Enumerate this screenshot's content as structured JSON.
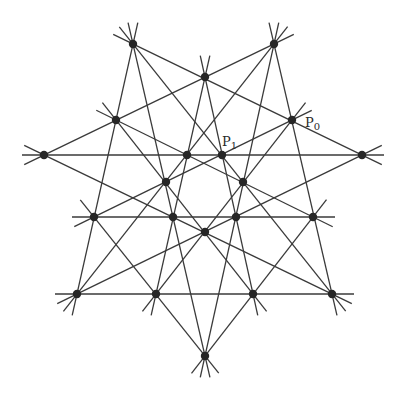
{
  "figure": {
    "line_color": "#3a3a3a",
    "point_color": "#262626",
    "point_radius": 4.2,
    "line_extension": 22
  },
  "points": {
    "A": [
      133,
      44
    ],
    "B": [
      274,
      44
    ],
    "C": [
      205,
      77
    ],
    "D": [
      116,
      120
    ],
    "E": [
      292,
      120
    ],
    "F": [
      44,
      155
    ],
    "G": [
      187,
      155
    ],
    "H": [
      222,
      155
    ],
    "I": [
      362,
      155
    ],
    "J": [
      166,
      182
    ],
    "K": [
      243,
      182
    ],
    "L": [
      94,
      217
    ],
    "M": [
      173,
      217
    ],
    "N": [
      236,
      217
    ],
    "O": [
      313,
      217
    ],
    "Q": [
      205,
      232
    ],
    "R": [
      77,
      294
    ],
    "S": [
      156,
      294
    ],
    "T": [
      253,
      294
    ],
    "U": [
      332,
      294
    ],
    "V": [
      205,
      356
    ]
  },
  "lines": [
    [
      "F",
      "G",
      "H",
      "I"
    ],
    [
      "L",
      "M",
      "N",
      "O"
    ],
    [
      "R",
      "S",
      "T",
      "U"
    ],
    [
      "A",
      "C",
      "E",
      "I"
    ],
    [
      "B",
      "C",
      "D",
      "F"
    ],
    [
      "A",
      "D",
      "L",
      "R"
    ],
    [
      "B",
      "E",
      "O",
      "U"
    ],
    [
      "A",
      "M",
      "V"
    ],
    [
      "B",
      "N",
      "V"
    ],
    [
      "A",
      "H",
      "K",
      "U"
    ],
    [
      "B",
      "G",
      "J",
      "R"
    ],
    [
      "C",
      "G",
      "M",
      "S"
    ],
    [
      "C",
      "H",
      "N",
      "T"
    ],
    [
      "D",
      "G",
      "K",
      "O"
    ],
    [
      "E",
      "H",
      "J",
      "L"
    ],
    [
      "F",
      "M",
      "Q",
      "U"
    ],
    [
      "I",
      "N",
      "Q",
      "R"
    ],
    [
      "D",
      "J",
      "Q",
      "T"
    ],
    [
      "E",
      "K",
      "Q",
      "S"
    ],
    [
      "O",
      "T",
      "V"
    ],
    [
      "L",
      "S",
      "V"
    ]
  ],
  "labels": [
    {
      "point": "E",
      "base": "P",
      "sub": "0",
      "x": 305,
      "y": 127
    },
    {
      "point": "H",
      "base": "P",
      "sub": "1",
      "x": 222,
      "y": 146
    }
  ]
}
